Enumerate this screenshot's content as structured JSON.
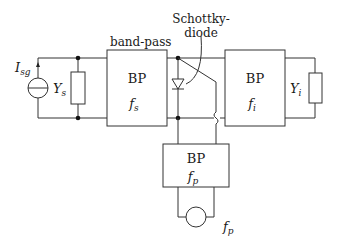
{
  "diagram": {
    "type": "circuit-schematic",
    "labels": {
      "source_current": "I",
      "source_current_sub": "sg",
      "source_admittance": "Y",
      "source_admittance_sub": "s",
      "bandpass_caption": "band-pass",
      "diode_caption_line1": "Schottky-",
      "diode_caption_line2": "diode",
      "load_admittance": "Y",
      "load_admittance_sub": "i",
      "pump_frequency": "f",
      "pump_frequency_sub": "p"
    },
    "blocks": [
      {
        "id": "bp-signal",
        "title": "BP",
        "freq": "f",
        "freq_sub": "s"
      },
      {
        "id": "bp-idler",
        "title": "BP",
        "freq": "f",
        "freq_sub": "i"
      },
      {
        "id": "bp-pump",
        "title": "BP",
        "freq": "f",
        "freq_sub": "p"
      }
    ],
    "colors": {
      "line": "#333333",
      "background": "#ffffff"
    }
  }
}
